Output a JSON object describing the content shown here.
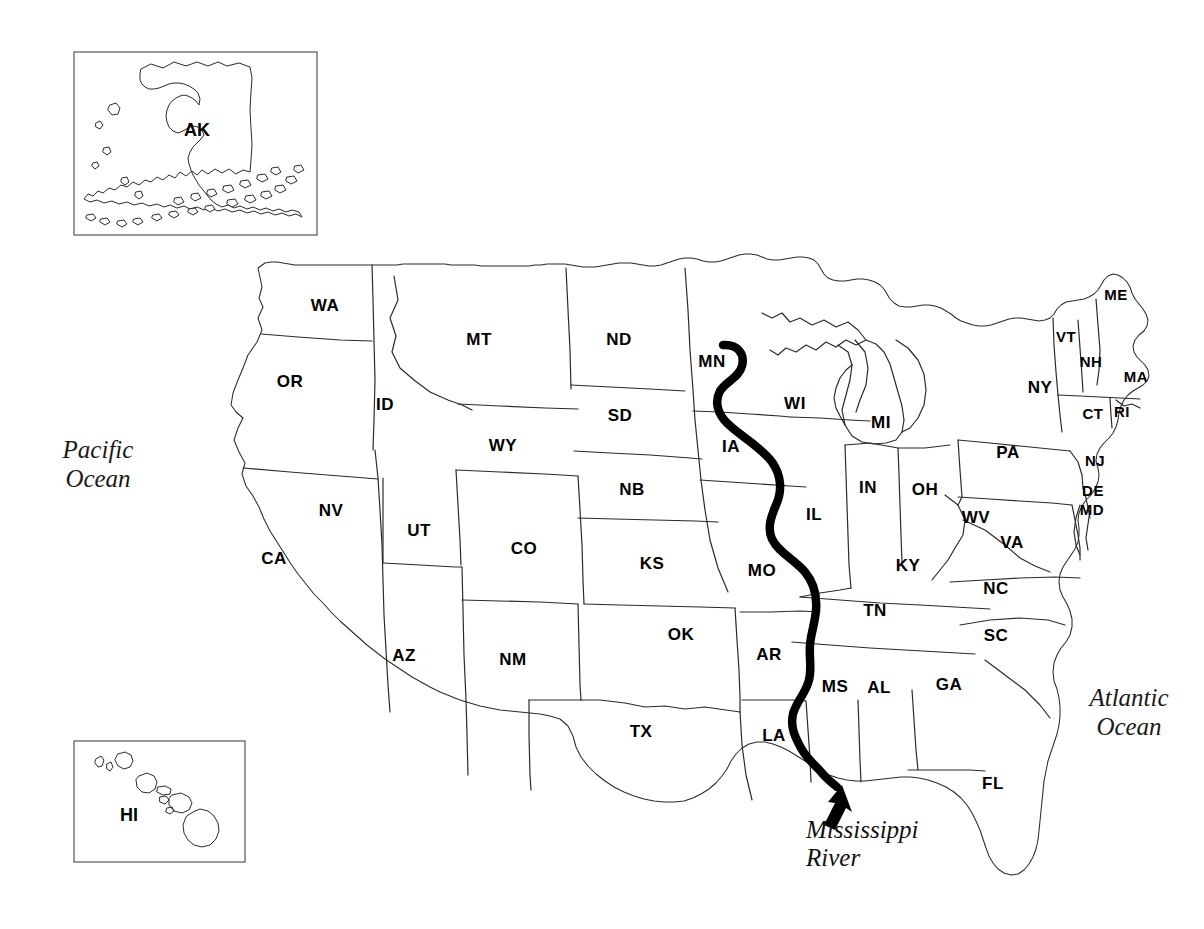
{
  "map": {
    "title": "United States map with state abbreviations and Mississippi River",
    "background_color": "#ffffff",
    "line_color": "#2b2b2b",
    "river_color": "#000000"
  },
  "insets": [
    {
      "id": "alaska",
      "label": "AK",
      "name": "alaska-inset"
    },
    {
      "id": "hawaii",
      "label": "HI",
      "name": "hawaii-inset"
    }
  ],
  "oceans": [
    {
      "name": "pacific-ocean-label",
      "line1": "Pacific",
      "line2": "Ocean"
    },
    {
      "name": "atlantic-ocean-label",
      "line1": "Atlantic",
      "line2": "Ocean"
    }
  ],
  "river": {
    "name": "mississippi-river",
    "label_line1": "Mississippi",
    "label_line2": "River"
  },
  "states": [
    {
      "abbr": "WA",
      "x": 325,
      "y": 307
    },
    {
      "abbr": "OR",
      "x": 290,
      "y": 383
    },
    {
      "abbr": "ID",
      "x": 385,
      "y": 406
    },
    {
      "abbr": "MT",
      "x": 479,
      "y": 341
    },
    {
      "abbr": "WY",
      "x": 503,
      "y": 447
    },
    {
      "abbr": "ND",
      "x": 619,
      "y": 341
    },
    {
      "abbr": "SD",
      "x": 620,
      "y": 417
    },
    {
      "abbr": "NB",
      "x": 632,
      "y": 491
    },
    {
      "abbr": "MN",
      "x": 712,
      "y": 363
    },
    {
      "abbr": "IA",
      "x": 731,
      "y": 448
    },
    {
      "abbr": "WI",
      "x": 795,
      "y": 405
    },
    {
      "abbr": "MI",
      "x": 881,
      "y": 424
    },
    {
      "abbr": "NV",
      "x": 331,
      "y": 512
    },
    {
      "abbr": "UT",
      "x": 419,
      "y": 532
    },
    {
      "abbr": "CA",
      "x": 274,
      "y": 560
    },
    {
      "abbr": "CO",
      "x": 524,
      "y": 550
    },
    {
      "abbr": "KS",
      "x": 652,
      "y": 565
    },
    {
      "abbr": "MO",
      "x": 762,
      "y": 572
    },
    {
      "abbr": "IL",
      "x": 814,
      "y": 516
    },
    {
      "abbr": "IN",
      "x": 868,
      "y": 489
    },
    {
      "abbr": "OH",
      "x": 925,
      "y": 491
    },
    {
      "abbr": "WV",
      "x": 976,
      "y": 519
    },
    {
      "abbr": "VA",
      "x": 1012,
      "y": 544
    },
    {
      "abbr": "KY",
      "x": 908,
      "y": 567
    },
    {
      "abbr": "NC",
      "x": 996,
      "y": 590
    },
    {
      "abbr": "TN",
      "x": 875,
      "y": 612
    },
    {
      "abbr": "SC",
      "x": 996,
      "y": 637
    },
    {
      "abbr": "AZ",
      "x": 404,
      "y": 657
    },
    {
      "abbr": "NM",
      "x": 513,
      "y": 661
    },
    {
      "abbr": "OK",
      "x": 681,
      "y": 636
    },
    {
      "abbr": "AR",
      "x": 769,
      "y": 656
    },
    {
      "abbr": "MS",
      "x": 835,
      "y": 688
    },
    {
      "abbr": "AL",
      "x": 879,
      "y": 689
    },
    {
      "abbr": "GA",
      "x": 949,
      "y": 686
    },
    {
      "abbr": "TX",
      "x": 641,
      "y": 733
    },
    {
      "abbr": "LA",
      "x": 774,
      "y": 737
    },
    {
      "abbr": "FL",
      "x": 993,
      "y": 785
    },
    {
      "abbr": "ME",
      "x": 1116,
      "y": 296
    },
    {
      "abbr": "VT",
      "x": 1066,
      "y": 338
    },
    {
      "abbr": "NH",
      "x": 1091,
      "y": 363
    },
    {
      "abbr": "MA",
      "x": 1136,
      "y": 378
    },
    {
      "abbr": "NY",
      "x": 1040,
      "y": 389
    },
    {
      "abbr": "CT",
      "x": 1093,
      "y": 415
    },
    {
      "abbr": "RI",
      "x": 1122,
      "y": 413
    },
    {
      "abbr": "PA",
      "x": 1008,
      "y": 454
    },
    {
      "abbr": "NJ",
      "x": 1095,
      "y": 462
    },
    {
      "abbr": "DE",
      "x": 1093,
      "y": 492
    },
    {
      "abbr": "MD",
      "x": 1092,
      "y": 511
    }
  ]
}
